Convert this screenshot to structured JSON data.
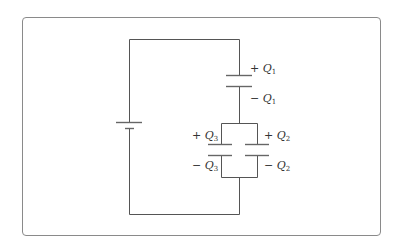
{
  "diagram": {
    "type": "circuit",
    "colors": {
      "wire": "#555555",
      "frame": "#8a8a8a",
      "text": "#333333"
    },
    "components": {
      "battery": {
        "label": ""
      },
      "c1": {
        "plus_sign": "+",
        "plus_symbol": "Q",
        "plus_sub": "1",
        "minus_sign": "−",
        "minus_symbol": "Q",
        "minus_sub": "1"
      },
      "c2": {
        "plus_sign": "+",
        "plus_symbol": "Q",
        "plus_sub": "2",
        "minus_sign": "−",
        "minus_symbol": "Q",
        "minus_sub": "2"
      },
      "c3": {
        "plus_sign": "+",
        "plus_symbol": "Q",
        "plus_sub": "3",
        "minus_sign": "−",
        "minus_symbol": "Q",
        "minus_sub": "3"
      }
    }
  }
}
